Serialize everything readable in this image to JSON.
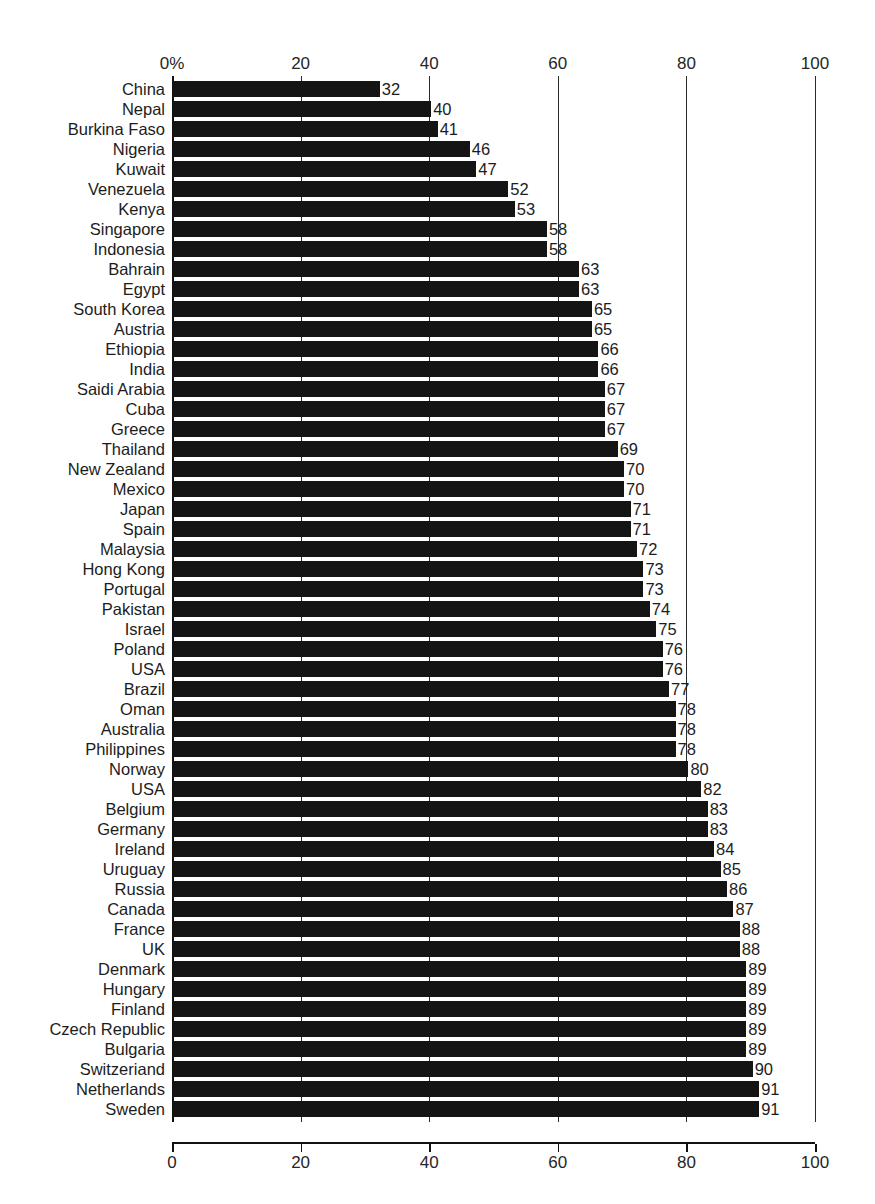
{
  "figure": {
    "title_remnant": "",
    "percent_suffix_label": "0%"
  },
  "axis": {
    "top_ticks": [
      "0%",
      "20",
      "40",
      "60",
      "80",
      "100"
    ],
    "top_tick_values": [
      0,
      20,
      40,
      60,
      80,
      100
    ],
    "bottom_ticks": [
      "0",
      "20",
      "40",
      "60",
      "80",
      "100"
    ],
    "bottom_tick_values": [
      0,
      20,
      40,
      60,
      80,
      100
    ]
  },
  "colors": {
    "bar": "#141414",
    "gridline": "#2a2a2a",
    "axis": "#111111",
    "text": "#1c1c1c",
    "background": "#ffffff"
  },
  "chart_data": {
    "type": "bar",
    "orientation": "horizontal",
    "title": "",
    "subtitle": "",
    "xlabel": "",
    "ylabel": "",
    "xlim": [
      0,
      100
    ],
    "grid": true,
    "legend": false,
    "value_labels": true,
    "categories": [
      "China",
      "Nepal",
      "Burkina Faso",
      "Nigeria",
      "Kuwait",
      "Venezuela",
      "Kenya",
      "Singapore",
      "Indonesia",
      "Bahrain",
      "Egypt",
      "South Korea",
      "Austria",
      "Ethiopia",
      "India",
      "Saidi Arabia",
      "Cuba",
      "Greece",
      "Thailand",
      "New Zealand",
      "Mexico",
      "Japan",
      "Spain",
      "Malaysia",
      "Hong Kong",
      "Portugal",
      "Pakistan",
      "Israel",
      "Poland",
      "USA",
      "Brazil",
      "Oman",
      "Australia",
      "Philippines",
      "Norway",
      "USA",
      "Belgium",
      "Germany",
      "Ireland",
      "Uruguay",
      "Russia",
      "Canada",
      "France",
      "UK",
      "Denmark",
      "Hungary",
      "Finland",
      "Czech Republic",
      "Bulgaria",
      "Switzeriand",
      "Netherlands",
      "Sweden"
    ],
    "values": [
      32,
      40,
      41,
      46,
      47,
      52,
      53,
      58,
      58,
      63,
      63,
      65,
      65,
      66,
      66,
      67,
      67,
      67,
      69,
      70,
      70,
      71,
      71,
      72,
      73,
      73,
      74,
      75,
      76,
      76,
      77,
      78,
      78,
      78,
      80,
      82,
      83,
      83,
      84,
      85,
      86,
      87,
      88,
      88,
      89,
      89,
      89,
      89,
      89,
      90,
      91,
      91
    ]
  }
}
